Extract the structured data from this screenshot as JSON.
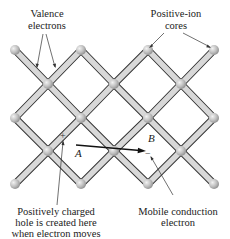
{
  "labels": {
    "valence_line1": "Valence",
    "valence_line2": "electrons",
    "ion_line1": "Positive-ion",
    "ion_line2": "cores",
    "hole_line1": "Positively charged",
    "hole_line2": "hole is created here",
    "hole_line3": "when electron moves",
    "mobile_line1": "Mobile conduction",
    "mobile_line2": "electron",
    "point_a": "A",
    "point_b": "B",
    "plus_sign": "+",
    "minus_sign": "−"
  },
  "lattice": {
    "rows": [
      {
        "y": 50,
        "x": [
          15,
          81,
          148,
          214
        ]
      },
      {
        "y": 84,
        "x": [
          48,
          114,
          181
        ]
      },
      {
        "y": 118,
        "x": [
          15,
          81,
          148,
          214
        ]
      },
      {
        "y": 151,
        "x": [
          48,
          114,
          181
        ]
      },
      {
        "y": 184,
        "x": [
          15,
          81,
          148,
          214
        ]
      }
    ],
    "bond_color": "#d8d8d8",
    "bond_edge_color": "#333333",
    "ion_color": "#b0b0b0"
  }
}
